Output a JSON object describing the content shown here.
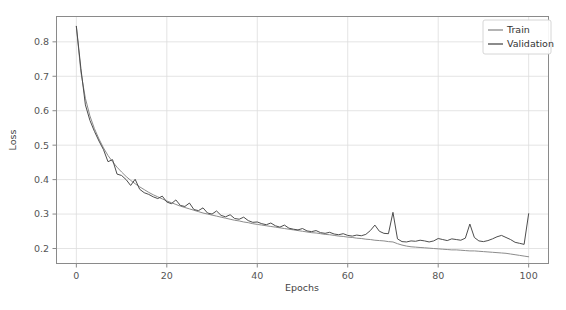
{
  "chart_data": {
    "type": "line",
    "title": "",
    "xlabel": "Epochs",
    "ylabel": "Loss",
    "xlim": [
      -4.5,
      104.5
    ],
    "ylim": [
      0.155,
      0.875
    ],
    "xticks": [
      0,
      20,
      40,
      60,
      80,
      100
    ],
    "xtick_labels": [
      "0",
      "20",
      "40",
      "60",
      "80",
      "100"
    ],
    "yticks": [
      0.2,
      0.3,
      0.4,
      0.5,
      0.6,
      0.7,
      0.8
    ],
    "ytick_labels": [
      "0.2",
      "0.3",
      "0.4",
      "0.5",
      "0.6",
      "0.7",
      "0.8"
    ],
    "grid": true,
    "legend_position": "upper right",
    "x": [
      0,
      1,
      2,
      3,
      4,
      5,
      6,
      7,
      8,
      9,
      10,
      11,
      12,
      13,
      14,
      15,
      16,
      17,
      18,
      19,
      20,
      21,
      22,
      23,
      24,
      25,
      26,
      27,
      28,
      29,
      30,
      31,
      32,
      33,
      34,
      35,
      36,
      37,
      38,
      39,
      40,
      41,
      42,
      43,
      44,
      45,
      46,
      47,
      48,
      49,
      50,
      51,
      52,
      53,
      54,
      55,
      56,
      57,
      58,
      59,
      60,
      61,
      62,
      63,
      64,
      65,
      66,
      67,
      68,
      69,
      70,
      71,
      72,
      73,
      74,
      75,
      76,
      77,
      78,
      79,
      80,
      81,
      82,
      83,
      84,
      85,
      86,
      87,
      88,
      89,
      90,
      91,
      92,
      93,
      94,
      95,
      96,
      97,
      98,
      99,
      100
    ],
    "series": [
      {
        "name": "Train",
        "color": "#8c8c8c",
        "linewidth": 1.0,
        "values": [
          0.845,
          0.712,
          0.636,
          0.585,
          0.548,
          0.518,
          0.492,
          0.47,
          0.452,
          0.436,
          0.422,
          0.409,
          0.398,
          0.388,
          0.379,
          0.371,
          0.363,
          0.356,
          0.35,
          0.344,
          0.338,
          0.333,
          0.328,
          0.323,
          0.319,
          0.315,
          0.311,
          0.307,
          0.303,
          0.3,
          0.297,
          0.294,
          0.291,
          0.288,
          0.285,
          0.282,
          0.28,
          0.277,
          0.275,
          0.272,
          0.27,
          0.268,
          0.266,
          0.264,
          0.262,
          0.26,
          0.258,
          0.256,
          0.254,
          0.252,
          0.25,
          0.248,
          0.246,
          0.245,
          0.243,
          0.241,
          0.24,
          0.238,
          0.236,
          0.235,
          0.233,
          0.232,
          0.23,
          0.229,
          0.227,
          0.226,
          0.224,
          0.223,
          0.222,
          0.22,
          0.219,
          0.214,
          0.21,
          0.207,
          0.205,
          0.204,
          0.203,
          0.202,
          0.201,
          0.2,
          0.199,
          0.198,
          0.197,
          0.196,
          0.196,
          0.195,
          0.194,
          0.193,
          0.193,
          0.192,
          0.191,
          0.19,
          0.189,
          0.188,
          0.187,
          0.186,
          0.184,
          0.182,
          0.18,
          0.178,
          0.176
        ]
      },
      {
        "name": "Validation",
        "color": "#4d4d4d",
        "linewidth": 1.0,
        "values": [
          0.845,
          0.723,
          0.617,
          0.572,
          0.54,
          0.512,
          0.487,
          0.452,
          0.458,
          0.416,
          0.412,
          0.4,
          0.383,
          0.401,
          0.372,
          0.362,
          0.357,
          0.35,
          0.345,
          0.352,
          0.335,
          0.33,
          0.341,
          0.325,
          0.322,
          0.332,
          0.313,
          0.31,
          0.318,
          0.303,
          0.3,
          0.309,
          0.296,
          0.292,
          0.298,
          0.287,
          0.285,
          0.291,
          0.281,
          0.276,
          0.277,
          0.272,
          0.269,
          0.274,
          0.266,
          0.262,
          0.268,
          0.259,
          0.256,
          0.254,
          0.258,
          0.251,
          0.249,
          0.252,
          0.246,
          0.244,
          0.247,
          0.242,
          0.24,
          0.243,
          0.238,
          0.236,
          0.239,
          0.237,
          0.241,
          0.252,
          0.268,
          0.25,
          0.244,
          0.243,
          0.305,
          0.228,
          0.22,
          0.219,
          0.222,
          0.221,
          0.224,
          0.222,
          0.219,
          0.222,
          0.229,
          0.226,
          0.223,
          0.228,
          0.226,
          0.224,
          0.23,
          0.271,
          0.232,
          0.222,
          0.22,
          0.223,
          0.228,
          0.234,
          0.238,
          0.232,
          0.226,
          0.218,
          0.215,
          0.212,
          0.301
        ]
      }
    ]
  },
  "legend": {
    "entries": [
      {
        "label": "Train"
      },
      {
        "label": "Validation"
      }
    ]
  },
  "axes": {
    "xlabel": "Epochs",
    "ylabel": "Loss"
  }
}
